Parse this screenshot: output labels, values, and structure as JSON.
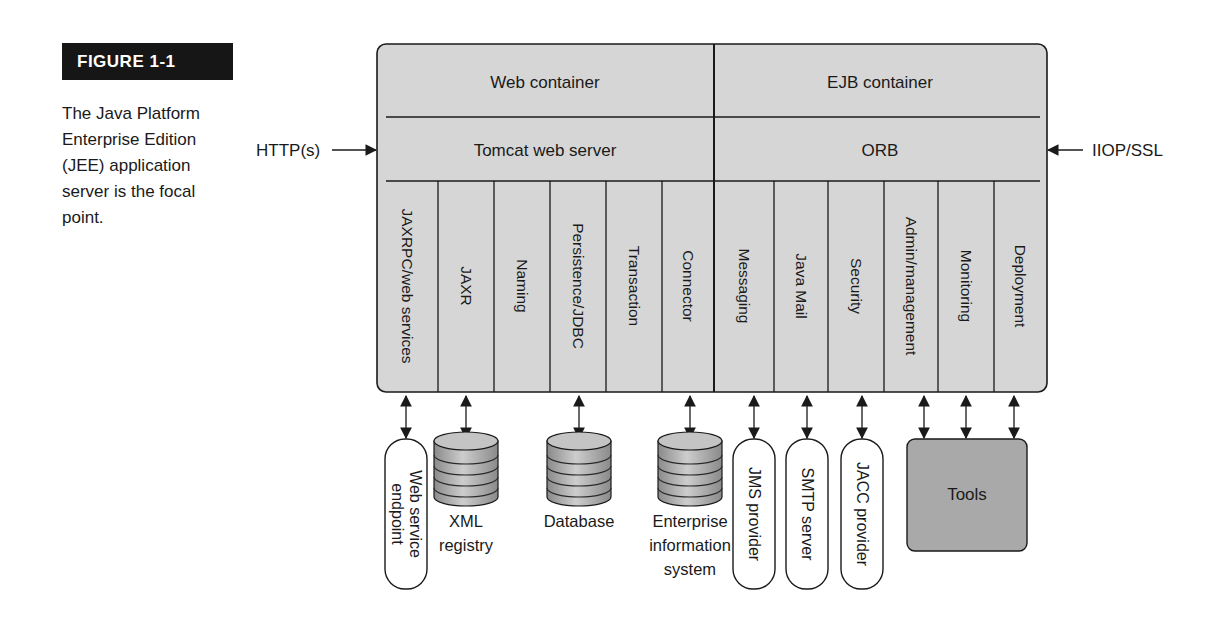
{
  "figure": {
    "tag": "FIGURE 1-1",
    "caption": "The Java Platform Enterprise Edition (JEE) application server is the focal point.",
    "caption_lines": [
      "The Java Platform",
      "Enterprise Edition",
      "(JEE) application",
      "server is the focal",
      "point."
    ]
  },
  "colors": {
    "server_fill": "#d6d6d6",
    "tools_fill": "#a9a9a9",
    "line": "#1a1a1a",
    "db_light": "#cfcfcf",
    "db_dark": "#8e8e8e"
  },
  "protocols": {
    "left": "HTTP(s)",
    "right": "IIOP/SSL"
  },
  "containers": {
    "web": {
      "title": "Web container",
      "server": "Tomcat web server"
    },
    "ejb": {
      "title": "EJB container",
      "server": "ORB"
    }
  },
  "services": [
    {
      "label": "JAXRPC/web services",
      "x0": 377,
      "x1": 438
    },
    {
      "label": "JAXR",
      "x0": 438,
      "x1": 494
    },
    {
      "label": "Naming",
      "x0": 494,
      "x1": 550
    },
    {
      "label": "Persistence/JDBC",
      "x0": 550,
      "x1": 606
    },
    {
      "label": "Transaction",
      "x0": 606,
      "x1": 662
    },
    {
      "label": "Connector",
      "x0": 662,
      "x1": 714
    },
    {
      "label": "Messaging",
      "x0": 714,
      "x1": 774
    },
    {
      "label": "Java Mail",
      "x0": 774,
      "x1": 828
    },
    {
      "label": "Security",
      "x0": 828,
      "x1": 884
    },
    {
      "label": "Admin/management",
      "x0": 884,
      "x1": 938
    },
    {
      "label": "Monitoring",
      "x0": 938,
      "x1": 994
    },
    {
      "label": "Deployment",
      "x0": 994,
      "x1": 1047
    }
  ],
  "external": [
    {
      "type": "pill",
      "label": "Web service endpoint",
      "lines": [
        "Web service",
        "endpoint"
      ],
      "cx": 406,
      "arrow_x": 406
    },
    {
      "type": "database",
      "label": "XML registry",
      "lines": [
        "XML",
        "registry"
      ],
      "cx": 466,
      "arrow_x": 466
    },
    {
      "type": "database",
      "label": "Database",
      "lines": [
        "Database"
      ],
      "cx": 579,
      "arrow_x": 579
    },
    {
      "type": "database",
      "label": "Enterprise information system",
      "lines": [
        "Enterprise",
        "information",
        "system"
      ],
      "cx": 690,
      "arrow_x": 690
    },
    {
      "type": "pill",
      "label": "JMS provider",
      "lines": [
        "JMS provider"
      ],
      "cx": 754,
      "arrow_x": 754
    },
    {
      "type": "pill",
      "label": "SMTP server",
      "lines": [
        "SMTP server"
      ],
      "cx": 807,
      "arrow_x": 807
    },
    {
      "type": "pill",
      "label": "JACC provider",
      "lines": [
        "JACC provider"
      ],
      "cx": 862,
      "arrow_x": 862
    },
    {
      "type": "box",
      "label": "Tools",
      "arrow_xs": [
        924,
        966,
        1014
      ]
    }
  ]
}
